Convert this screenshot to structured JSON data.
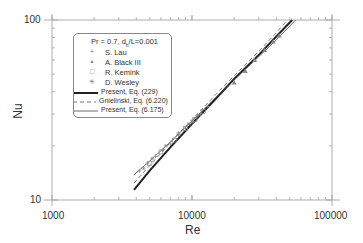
{
  "chart_data": {
    "type": "line",
    "title": "",
    "xlabel": "Re",
    "ylabel": "Nu",
    "xscale": "log",
    "yscale": "log",
    "xlim": [
      1000,
      100000
    ],
    "ylim": [
      10,
      100
    ],
    "x_ticks": [
      "1000",
      "10000",
      "100000"
    ],
    "y_ticks": [
      "10",
      "100"
    ],
    "grid": false,
    "legend_position": "upper left",
    "legend_title": "Pr = 0.7,  d_h/L=0.001",
    "series": [
      {
        "name": "S. Lau",
        "style": "marker",
        "marker": "+",
        "x": [
          4200,
          4800,
          5500,
          6200,
          7000,
          8000,
          9000,
          10000,
          11500,
          13000
        ],
        "y": [
          14.5,
          16,
          17.5,
          19,
          20.5,
          23,
          25,
          27,
          30,
          33
        ]
      },
      {
        "name": "A. Black III",
        "style": "marker",
        "marker": "triangle",
        "x": [
          20000,
          24000,
          28000,
          33000,
          38000,
          42000
        ],
        "y": [
          45,
          52,
          60,
          68,
          76,
          82
        ]
      },
      {
        "name": "R. Kemink",
        "style": "marker",
        "marker": "square",
        "x": [
          5000,
          6000,
          7500,
          9000,
          10500,
          12000
        ],
        "y": [
          16,
          18.5,
          21.5,
          25,
          28,
          31
        ]
      },
      {
        "name": "D. Wesley",
        "style": "marker",
        "marker": "asterisk",
        "x": [
          4500,
          5200,
          6500,
          8000,
          9500,
          11000
        ],
        "y": [
          15,
          17,
          20,
          23.5,
          26.5,
          29.5
        ]
      },
      {
        "name": "Present, Eq. (229)",
        "style": "thick-solid",
        "x": [
          3850,
          5000,
          7000,
          10000,
          15000,
          20000,
          30000,
          40000,
          52000
        ],
        "y": [
          11.4,
          14.6,
          19.6,
          26.5,
          37,
          47,
          64,
          81,
          100
        ]
      },
      {
        "name": "Gnielinski, Eq. (6.220)",
        "style": "dashed",
        "x": [
          3850,
          5000,
          7000,
          10000,
          15000,
          20000,
          30000,
          40000,
          48000
        ],
        "y": [
          12.4,
          15.6,
          20.8,
          28,
          39,
          49,
          67,
          85,
          100
        ]
      },
      {
        "name": "Present, Eq. (6.175)",
        "style": "thin-solid",
        "x": [
          3850,
          5000,
          7000,
          10000,
          15000,
          20000,
          30000,
          40000,
          55000
        ],
        "y": [
          13.8,
          16.5,
          21,
          27.5,
          37.5,
          46.5,
          62.5,
          77.5,
          100
        ]
      }
    ]
  },
  "legend": {
    "title_main": "Pr = 0.7,  d",
    "title_sub": "h",
    "title_end": "/L=0.001",
    "items": [
      {
        "symbol": "+",
        "label": "S. Lau"
      },
      {
        "symbol": "▲",
        "label": "A. Black III"
      },
      {
        "symbol": "□",
        "label": "R. Kemink"
      },
      {
        "symbol": "✳",
        "label": "D. Wesley"
      },
      {
        "label": "Present, Eq. (229)"
      },
      {
        "label": "Gnielinski, Eq. (6.220)"
      },
      {
        "label": "Present, Eq. (6.175)"
      }
    ]
  },
  "axes": {
    "x_ticks": [
      "1000",
      "10000",
      "100000"
    ],
    "y_ticks": [
      "100",
      "10"
    ],
    "xlabel": "Re",
    "ylabel": "Nu"
  },
  "colors": {
    "axis": "#999999",
    "thick_line": "#222222",
    "dashed_line": "#777777",
    "thin_line": "#444444",
    "markers": "#888888"
  }
}
